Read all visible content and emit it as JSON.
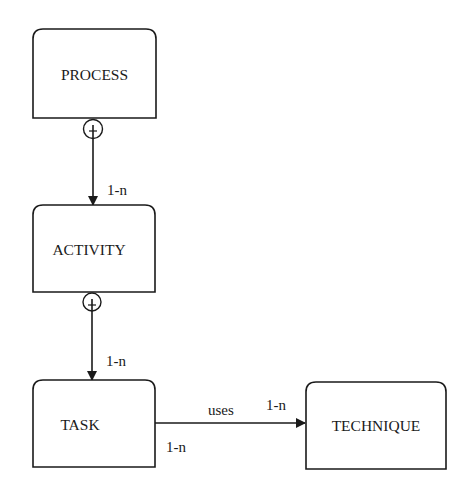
{
  "diagram": {
    "type": "entity-relationship",
    "background": "#ffffff",
    "stroke_color": "#1a1a1a",
    "nodes": [
      {
        "id": "process",
        "label": "PROCESS"
      },
      {
        "id": "activity",
        "label": "ACTIVITY"
      },
      {
        "id": "task",
        "label": "TASK"
      },
      {
        "id": "technique",
        "label": "TECHNIQUE"
      }
    ],
    "edges": [
      {
        "from": "process",
        "to": "activity",
        "source_marker": "circle-plus",
        "target_cardinality": "1-n"
      },
      {
        "from": "activity",
        "to": "task",
        "source_marker": "circle-plus",
        "target_cardinality": "1-n"
      },
      {
        "from": "task",
        "to": "technique",
        "label": "uses",
        "source_cardinality": "1-n",
        "target_cardinality": "1-n"
      }
    ]
  }
}
